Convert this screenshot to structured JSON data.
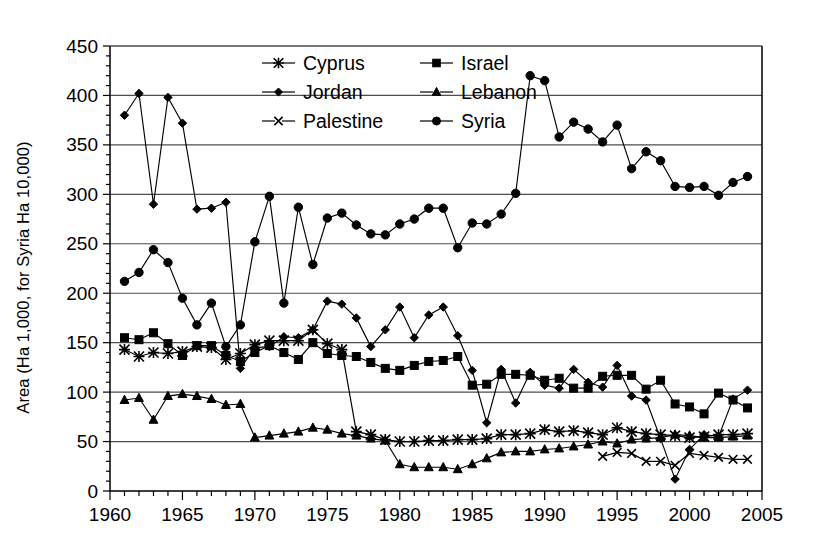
{
  "chart_data": {
    "type": "line",
    "title": "",
    "xlabel": "",
    "ylabel": "Area (Ha 1,000, for Syria Ha 10,000)",
    "xlim": [
      1960,
      2005
    ],
    "ylim": [
      0,
      450
    ],
    "ytick_step": 50,
    "xtick_step": 5,
    "xminor_step": 1,
    "grid": "horizontal",
    "legend_position": "top-center-inside",
    "yticks": [
      0,
      50,
      100,
      150,
      200,
      250,
      300,
      350,
      400,
      450
    ],
    "xticks": [
      1960,
      1965,
      1970,
      1975,
      1980,
      1985,
      1990,
      1995,
      2000,
      2005
    ],
    "series": [
      {
        "name": "Cyprus",
        "marker": "asterisk",
        "points": [
          [
            1961,
            143
          ],
          [
            1962,
            136
          ],
          [
            1963,
            140
          ],
          [
            1964,
            139
          ],
          [
            1965,
            141
          ],
          [
            1966,
            146
          ],
          [
            1967,
            145
          ],
          [
            1968,
            133
          ],
          [
            1969,
            139
          ],
          [
            1970,
            148
          ],
          [
            1971,
            152
          ],
          [
            1972,
            152
          ],
          [
            1973,
            152
          ],
          [
            1974,
            163
          ],
          [
            1975,
            149
          ],
          [
            1976,
            143
          ],
          [
            1977,
            60
          ],
          [
            1978,
            57
          ],
          [
            1979,
            52
          ],
          [
            1980,
            50
          ],
          [
            1981,
            50
          ],
          [
            1982,
            51
          ],
          [
            1983,
            51
          ],
          [
            1984,
            52
          ],
          [
            1985,
            52
          ],
          [
            1986,
            53
          ],
          [
            1987,
            57
          ],
          [
            1988,
            57
          ],
          [
            1989,
            58
          ],
          [
            1990,
            62
          ],
          [
            1991,
            60
          ],
          [
            1992,
            61
          ],
          [
            1993,
            59
          ],
          [
            1994,
            57
          ],
          [
            1995,
            64
          ],
          [
            1996,
            60
          ],
          [
            1997,
            58
          ],
          [
            1998,
            57
          ],
          [
            1999,
            56
          ],
          [
            2000,
            54
          ],
          [
            2001,
            55
          ],
          [
            2002,
            57
          ],
          [
            2003,
            57
          ],
          [
            2004,
            58
          ]
        ]
      },
      {
        "name": "Israel",
        "marker": "square",
        "points": [
          [
            1961,
            155
          ],
          [
            1962,
            153
          ],
          [
            1963,
            160
          ],
          [
            1964,
            149
          ],
          [
            1965,
            137
          ],
          [
            1966,
            147
          ],
          [
            1967,
            147
          ],
          [
            1968,
            137
          ],
          [
            1969,
            131
          ],
          [
            1970,
            140
          ],
          [
            1971,
            147
          ],
          [
            1972,
            140
          ],
          [
            1973,
            133
          ],
          [
            1974,
            150
          ],
          [
            1975,
            139
          ],
          [
            1976,
            137
          ],
          [
            1977,
            136
          ],
          [
            1978,
            130
          ],
          [
            1979,
            124
          ],
          [
            1980,
            122
          ],
          [
            1981,
            127
          ],
          [
            1982,
            131
          ],
          [
            1983,
            132
          ],
          [
            1984,
            136
          ],
          [
            1985,
            107
          ],
          [
            1986,
            108
          ],
          [
            1987,
            118
          ],
          [
            1988,
            118
          ],
          [
            1989,
            117
          ],
          [
            1990,
            112
          ],
          [
            1991,
            114
          ],
          [
            1992,
            104
          ],
          [
            1993,
            104
          ],
          [
            1994,
            116
          ],
          [
            1995,
            117
          ],
          [
            1996,
            117
          ],
          [
            1997,
            103
          ],
          [
            1998,
            112
          ],
          [
            1999,
            88
          ],
          [
            2000,
            85
          ],
          [
            2001,
            78
          ],
          [
            2002,
            99
          ],
          [
            2003,
            92
          ],
          [
            2004,
            84
          ]
        ]
      },
      {
        "name": "Jordan",
        "marker": "diamond",
        "points": [
          [
            1961,
            380
          ],
          [
            1962,
            402
          ],
          [
            1963,
            290
          ],
          [
            1964,
            398
          ],
          [
            1965,
            372
          ],
          [
            1966,
            285
          ],
          [
            1967,
            286
          ],
          [
            1968,
            292
          ],
          [
            1969,
            124
          ],
          [
            1970,
            145
          ],
          [
            1971,
            146
          ],
          [
            1972,
            156
          ],
          [
            1973,
            155
          ],
          [
            1974,
            163
          ],
          [
            1975,
            192
          ],
          [
            1976,
            189
          ],
          [
            1977,
            175
          ],
          [
            1978,
            146
          ],
          [
            1979,
            163
          ],
          [
            1980,
            186
          ],
          [
            1981,
            155
          ],
          [
            1982,
            178
          ],
          [
            1983,
            186
          ],
          [
            1984,
            157
          ],
          [
            1985,
            122
          ],
          [
            1986,
            69
          ],
          [
            1987,
            123
          ],
          [
            1988,
            89
          ],
          [
            1989,
            120
          ],
          [
            1990,
            107
          ],
          [
            1991,
            104
          ],
          [
            1992,
            123
          ],
          [
            1993,
            110
          ],
          [
            1994,
            105
          ],
          [
            1995,
            127
          ],
          [
            1996,
            96
          ],
          [
            1997,
            92
          ],
          [
            1998,
            53
          ],
          [
            1999,
            12
          ],
          [
            2000,
            42
          ],
          [
            2001,
            57
          ],
          [
            2002,
            55
          ],
          [
            2003,
            93
          ],
          [
            2004,
            102
          ]
        ]
      },
      {
        "name": "Lebanon",
        "marker": "triangle",
        "points": [
          [
            1961,
            92
          ],
          [
            1962,
            94
          ],
          [
            1963,
            72
          ],
          [
            1964,
            96
          ],
          [
            1965,
            98
          ],
          [
            1966,
            96
          ],
          [
            1967,
            93
          ],
          [
            1968,
            87
          ],
          [
            1969,
            88
          ],
          [
            1970,
            54
          ],
          [
            1971,
            56
          ],
          [
            1972,
            58
          ],
          [
            1973,
            60
          ],
          [
            1974,
            64
          ],
          [
            1975,
            62
          ],
          [
            1976,
            58
          ],
          [
            1977,
            56
          ],
          [
            1978,
            53
          ],
          [
            1979,
            51
          ],
          [
            1980,
            27
          ],
          [
            1981,
            24
          ],
          [
            1982,
            24
          ],
          [
            1983,
            24
          ],
          [
            1984,
            22
          ],
          [
            1985,
            27
          ],
          [
            1986,
            33
          ],
          [
            1987,
            39
          ],
          [
            1988,
            40
          ],
          [
            1989,
            40
          ],
          [
            1990,
            42
          ],
          [
            1991,
            43
          ],
          [
            1992,
            45
          ],
          [
            1993,
            47
          ],
          [
            1994,
            50
          ],
          [
            1995,
            48
          ],
          [
            1996,
            52
          ],
          [
            1997,
            53
          ],
          [
            1998,
            54
          ],
          [
            1999,
            57
          ],
          [
            2000,
            56
          ],
          [
            2001,
            54
          ],
          [
            2002,
            54
          ],
          [
            2003,
            55
          ],
          [
            2004,
            56
          ]
        ]
      },
      {
        "name": "Palestine",
        "marker": "cross",
        "points": [
          [
            1994,
            35
          ],
          [
            1995,
            39
          ],
          [
            1996,
            38
          ],
          [
            1997,
            30
          ],
          [
            1998,
            30
          ],
          [
            1999,
            26
          ],
          [
            2000,
            38
          ],
          [
            2001,
            36
          ],
          [
            2002,
            34
          ],
          [
            2003,
            32
          ],
          [
            2004,
            32
          ]
        ]
      },
      {
        "name": "Syria",
        "marker": "circle",
        "points": [
          [
            1961,
            212
          ],
          [
            1962,
            221
          ],
          [
            1963,
            244
          ],
          [
            1964,
            231
          ],
          [
            1965,
            195
          ],
          [
            1966,
            168
          ],
          [
            1967,
            190
          ],
          [
            1968,
            146
          ],
          [
            1969,
            168
          ],
          [
            1970,
            252
          ],
          [
            1971,
            298
          ],
          [
            1972,
            190
          ],
          [
            1973,
            287
          ],
          [
            1974,
            229
          ],
          [
            1975,
            276
          ],
          [
            1976,
            281
          ],
          [
            1977,
            269
          ],
          [
            1978,
            260
          ],
          [
            1979,
            259
          ],
          [
            1980,
            270
          ],
          [
            1981,
            275
          ],
          [
            1982,
            286
          ],
          [
            1983,
            286
          ],
          [
            1984,
            246
          ],
          [
            1985,
            271
          ],
          [
            1986,
            270
          ],
          [
            1987,
            280
          ],
          [
            1988,
            301
          ],
          [
            1989,
            420
          ],
          [
            1990,
            415
          ],
          [
            1991,
            358
          ],
          [
            1992,
            373
          ],
          [
            1993,
            366
          ],
          [
            1994,
            353
          ],
          [
            1995,
            370
          ],
          [
            1996,
            326
          ],
          [
            1997,
            343
          ],
          [
            1998,
            334
          ],
          [
            1999,
            308
          ],
          [
            2000,
            307
          ],
          [
            2001,
            308
          ],
          [
            2002,
            299
          ],
          [
            2003,
            312
          ],
          [
            2004,
            318
          ]
        ]
      }
    ]
  },
  "legend": {
    "entries": [
      {
        "label": "Cyprus",
        "marker": "asterisk"
      },
      {
        "label": "Israel",
        "marker": "square"
      },
      {
        "label": "Jordan",
        "marker": "diamond"
      },
      {
        "label": "Lebanon",
        "marker": "triangle"
      },
      {
        "label": "Palestine",
        "marker": "cross"
      },
      {
        "label": "Syria",
        "marker": "circle"
      }
    ]
  },
  "colors": {
    "line": "#000000",
    "grid": "#4d4d4d",
    "axis": "#000000",
    "background": "#ffffff"
  }
}
